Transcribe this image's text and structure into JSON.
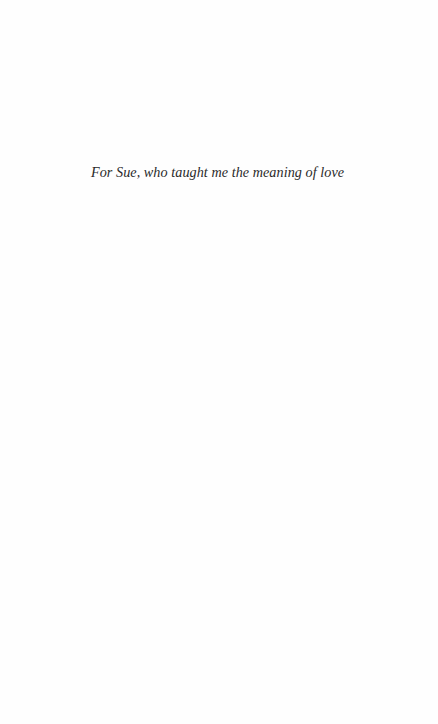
{
  "page": {
    "type": "dedication",
    "dedication_text": "For Sue, who taught me the meaning of love"
  },
  "colors": {
    "background": "#fefefe",
    "text": "#2a2a2a"
  }
}
